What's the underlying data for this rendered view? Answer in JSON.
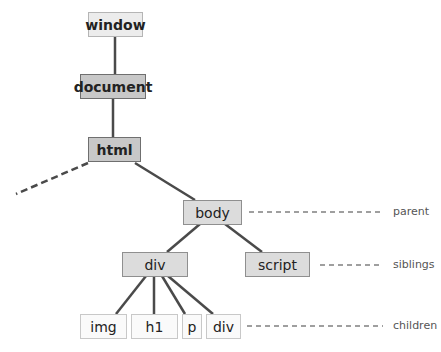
{
  "diagram": {
    "title": "",
    "nodes": {
      "window": {
        "label": "window"
      },
      "document": {
        "label": "document"
      },
      "html": {
        "label": "html"
      },
      "body": {
        "label": "body"
      },
      "div": {
        "label": "div"
      },
      "script": {
        "label": "script"
      },
      "img": {
        "label": "img"
      },
      "h1": {
        "label": "h1"
      },
      "p": {
        "label": "p"
      },
      "div2": {
        "label": "div"
      }
    },
    "edges": [
      [
        "window",
        "document"
      ],
      [
        "document",
        "html"
      ],
      [
        "html",
        "body"
      ],
      [
        "html",
        "offscreen (dashed)"
      ],
      [
        "body",
        "div"
      ],
      [
        "body",
        "script"
      ],
      [
        "div",
        "img"
      ],
      [
        "div",
        "h1"
      ],
      [
        "div",
        "p"
      ],
      [
        "div",
        "div2"
      ]
    ],
    "legend": {
      "parent": "parent",
      "siblings": "siblings",
      "children": "children"
    },
    "colors": {
      "edge": "#444444",
      "legend_line": "#777777"
    }
  }
}
